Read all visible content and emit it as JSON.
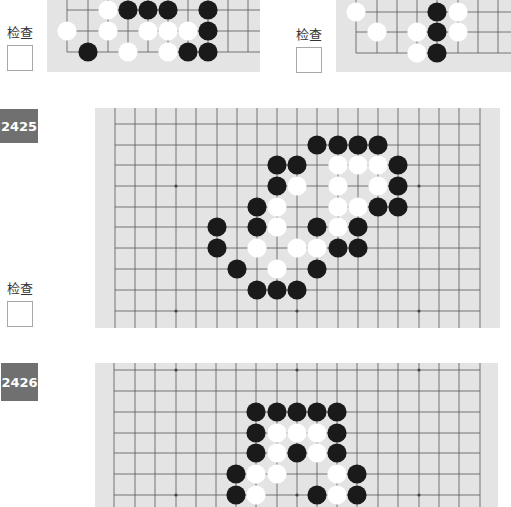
{
  "check_label": "检查",
  "problems": [
    {
      "id": "prev-left",
      "label": "检查"
    },
    {
      "id": "prev-right",
      "label": "检查"
    },
    {
      "id": "2425",
      "number": "2425",
      "label": "检查"
    },
    {
      "id": "2426",
      "number": "2426"
    }
  ],
  "colors": {
    "badge": "#707070",
    "board": "#e4e4e4",
    "grid": "#555555",
    "black": "#1a1a1a",
    "white": "#ffffff"
  },
  "boards": {
    "top_left": {
      "x": 47,
      "y": -10,
      "w": 213,
      "h": 82,
      "vlines": [
        67,
        88,
        108,
        128,
        148,
        168,
        188,
        208,
        228,
        248
      ],
      "hlines": [
        -10,
        10,
        31,
        52
      ],
      "left_edge": 67,
      "bottom_edge": 52,
      "black": [
        [
          128,
          10
        ],
        [
          148,
          10
        ],
        [
          168,
          10
        ],
        [
          208,
          10
        ],
        [
          208,
          31
        ],
        [
          88,
          52
        ],
        [
          188,
          52
        ],
        [
          208,
          52
        ]
      ],
      "white": [
        [
          108,
          10
        ],
        [
          67,
          31
        ],
        [
          108,
          31
        ],
        [
          148,
          31
        ],
        [
          168,
          31
        ],
        [
          188,
          31
        ],
        [
          128,
          52
        ],
        [
          168,
          52
        ]
      ]
    },
    "top_right": {
      "x": 336,
      "y": -10,
      "w": 175,
      "h": 82,
      "vlines": [
        356,
        377,
        397,
        417,
        437,
        458,
        478,
        498
      ],
      "hlines": [
        -9,
        12,
        32,
        53
      ],
      "left_edge": 356,
      "bottom_edge": 53,
      "black": [
        [
          437,
          12
        ],
        [
          437,
          32
        ],
        [
          437,
          53
        ]
      ],
      "white": [
        [
          356,
          12
        ],
        [
          458,
          12
        ],
        [
          377,
          32
        ],
        [
          417,
          32
        ],
        [
          458,
          32
        ],
        [
          417,
          53
        ]
      ]
    },
    "b2425": {
      "x": 95,
      "y": 108,
      "w": 405,
      "h": 220,
      "vlines": [
        115,
        135,
        156,
        176,
        196,
        217,
        237,
        257,
        277,
        297,
        317,
        338,
        358,
        378,
        398,
        419,
        439,
        459,
        480
      ],
      "hlines": [
        124,
        145,
        165,
        186,
        207,
        227,
        248,
        269,
        290,
        311
      ],
      "left_edge": 115,
      "right_edge": 480,
      "stars": [
        [
          176,
          186
        ],
        [
          419,
          186
        ],
        [
          176,
          311
        ],
        [
          297,
          311
        ],
        [
          419,
          311
        ]
      ],
      "black": [
        [
          317,
          145
        ],
        [
          338,
          145
        ],
        [
          358,
          145
        ],
        [
          378,
          145
        ],
        [
          277,
          165
        ],
        [
          297,
          165
        ],
        [
          398,
          165
        ],
        [
          277,
          186
        ],
        [
          398,
          186
        ],
        [
          257,
          207
        ],
        [
          378,
          207
        ],
        [
          398,
          207
        ],
        [
          217,
          227
        ],
        [
          257,
          227
        ],
        [
          317,
          227
        ],
        [
          358,
          227
        ],
        [
          217,
          248
        ],
        [
          338,
          248
        ],
        [
          358,
          248
        ],
        [
          237,
          269
        ],
        [
          317,
          269
        ],
        [
          257,
          290
        ],
        [
          277,
          290
        ],
        [
          297,
          290
        ]
      ],
      "white": [
        [
          338,
          165
        ],
        [
          358,
          165
        ],
        [
          378,
          165
        ],
        [
          297,
          186
        ],
        [
          338,
          186
        ],
        [
          378,
          186
        ],
        [
          277,
          207
        ],
        [
          338,
          207
        ],
        [
          358,
          207
        ],
        [
          277,
          227
        ],
        [
          338,
          227
        ],
        [
          257,
          248
        ],
        [
          297,
          248
        ],
        [
          317,
          248
        ],
        [
          277,
          269
        ]
      ]
    },
    "b2426": {
      "x": 95,
      "y": 363,
      "w": 403,
      "h": 144,
      "vlines": [
        114,
        135,
        155,
        176,
        196,
        216,
        236,
        256,
        277,
        297,
        317,
        337,
        357,
        378,
        398,
        419,
        439,
        459,
        480
      ],
      "hlines": [
        370,
        391,
        412,
        433,
        453,
        474,
        495,
        516
      ],
      "left_edge": 114,
      "right_edge": 480,
      "stars": [
        [
          176,
          370
        ],
        [
          297,
          370
        ],
        [
          419,
          370
        ],
        [
          176,
          495
        ],
        [
          297,
          495
        ],
        [
          419,
          495
        ]
      ],
      "black": [
        [
          256,
          412
        ],
        [
          277,
          412
        ],
        [
          297,
          412
        ],
        [
          317,
          412
        ],
        [
          337,
          412
        ],
        [
          256,
          433
        ],
        [
          337,
          433
        ],
        [
          256,
          453
        ],
        [
          297,
          453
        ],
        [
          337,
          453
        ],
        [
          236,
          474
        ],
        [
          357,
          474
        ],
        [
          236,
          495
        ],
        [
          317,
          495
        ],
        [
          357,
          495
        ]
      ],
      "white": [
        [
          277,
          433
        ],
        [
          297,
          433
        ],
        [
          317,
          433
        ],
        [
          277,
          453
        ],
        [
          317,
          453
        ],
        [
          256,
          474
        ],
        [
          277,
          474
        ],
        [
          337,
          474
        ],
        [
          256,
          495
        ],
        [
          337,
          495
        ]
      ]
    }
  }
}
